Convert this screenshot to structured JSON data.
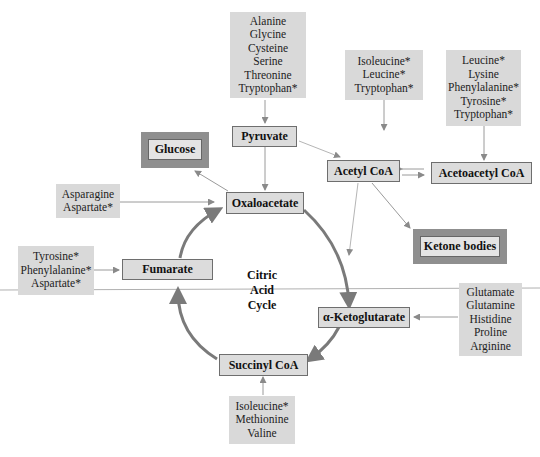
{
  "diagram": {
    "center_label": [
      "Citric",
      "Acid",
      "Cycle"
    ],
    "intermediates": {
      "pyruvate": "Pyruvate",
      "acetyl_coa": "Acetyl CoA",
      "acetoacetyl_coa": "Acetoacetyl CoA",
      "oxaloacetate": "Oxaloacetate",
      "fumarate": "Fumarate",
      "alpha_ketoglutarate": "α-Ketoglutarate",
      "succinyl_coa": "Succinyl CoA"
    },
    "products": {
      "glucose": "Glucose",
      "ketone_bodies": "Ketone bodies"
    },
    "amino_acid_groups": {
      "to_pyruvate": [
        "Alanine",
        "Glycine",
        "Cysteine",
        "Serine",
        "Threonine",
        "Tryptophan*"
      ],
      "to_acetyl_coa": [
        "Isoleucine*",
        "Leucine*",
        "Tryptophan*"
      ],
      "to_acetoacetyl_coa": [
        "Leucine*",
        "Lysine",
        "Phenylalanine*",
        "Tyrosine*",
        "Tryptophan*"
      ],
      "to_oxaloacetate": [
        "Asparagine",
        "Aspartate*"
      ],
      "to_fumarate": [
        "Tyrosine*",
        "Phenylalanine*",
        "Aspartate*"
      ],
      "to_alpha_ketoglutarate": [
        "Glutamate",
        "Glutamine",
        "Histidine",
        "Proline",
        "Arginine"
      ],
      "to_succinyl_coa": [
        "Isoleucine*",
        "Methionine",
        "Valine"
      ]
    },
    "colors": {
      "box_fill": "#d9d9d9",
      "node_border": "#6e6e6e",
      "product_frame": "#8f8f8f",
      "cycle_arrow": "#7a7a7a",
      "thin_arrow": "#9a9a9a"
    }
  }
}
